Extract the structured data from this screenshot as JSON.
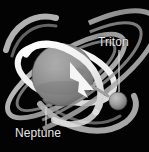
{
  "figure": {
    "background_color": "#030303",
    "width": 149,
    "height": 152
  },
  "labels": {
    "triton": {
      "text": "Triton",
      "color": "#e8e8e8",
      "x": 98,
      "y": 36,
      "leader_line": {
        "x1": 119,
        "y1": 50,
        "x2": 119,
        "y2": 92
      }
    },
    "neptune": {
      "text": "Neptune",
      "color": "#e8e8e8",
      "x": 15,
      "y": 127,
      "leader_line": {
        "x1": 46,
        "y1": 107,
        "x2": 46,
        "y2": 125
      }
    }
  },
  "objects": {
    "neptune_planet": {
      "name": "Neptune",
      "shape": "sphere",
      "cx": 63,
      "cy": 75,
      "r": 31,
      "fill_color": "#8d8d8d",
      "highlight_color": "#a9a9a9",
      "shadow_color": "#5a5a5a"
    },
    "triton_moon": {
      "name": "Triton",
      "shape": "sphere",
      "cx": 118,
      "cy": 101,
      "r": 9,
      "fill_color": "#9a9a9a",
      "highlight_color": "#b8b8b8",
      "shadow_color": "#5e5e5e"
    },
    "ring_outer": {
      "name": "outer ring",
      "shape": "tilted-ellipse",
      "cx": 66,
      "cy": 76,
      "rx": 68,
      "ry": 23,
      "rotation_deg": -33,
      "stroke_color": "#bdbdbd",
      "stroke_width": 5
    },
    "ring_inner": {
      "name": "inner ring",
      "shape": "tilted-ellipse",
      "cx": 66,
      "cy": 76,
      "rx": 57,
      "ry": 18,
      "rotation_deg": -33,
      "stroke_color": "#8a8a8a",
      "stroke_width": 3
    },
    "triton_orbit": {
      "name": "Triton retrograde orbit path",
      "shape": "tilted-ellipse",
      "cx": 66,
      "cy": 74,
      "rx": 50,
      "ry": 26,
      "rotation_deg": 18,
      "stroke_color": "#f2f2f2",
      "stroke_width": 6
    },
    "direction_arrow": {
      "name": "orbit direction arrow",
      "shape": "arrowhead",
      "points": "93,88 72,63 74,79 85,92",
      "fill_color": "#f5f5f5",
      "direction": "up-left"
    }
  },
  "colors": {
    "background": "#030303",
    "planet_grey": "#8d8d8d",
    "ring_grey": "#bdbdbd",
    "orbit_white": "#f2f2f2",
    "text_white": "#e8e8e8"
  }
}
